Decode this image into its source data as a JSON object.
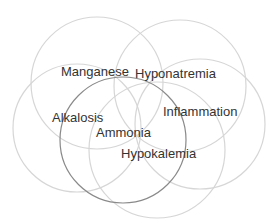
{
  "diagram": {
    "type": "overlapping-circles",
    "colors": {
      "background": "#ffffff",
      "light_circle": "#d6d6d6",
      "dark_circle": "#8a8a8a",
      "text": "#333333"
    },
    "circles": [
      {
        "name": "manganese",
        "cx": 97,
        "cy": 83,
        "r": 66,
        "style": "light"
      },
      {
        "name": "hyponatremia",
        "cx": 180,
        "cy": 86,
        "r": 66,
        "style": "light"
      },
      {
        "name": "alkalosis",
        "cx": 77,
        "cy": 128,
        "r": 64,
        "style": "light"
      },
      {
        "name": "inflammation",
        "cx": 200,
        "cy": 124,
        "r": 65,
        "style": "light"
      },
      {
        "name": "hypokalemia",
        "cx": 157,
        "cy": 150,
        "r": 68,
        "style": "light"
      },
      {
        "name": "ammonia",
        "cx": 123,
        "cy": 140,
        "r": 63,
        "style": "dark"
      }
    ],
    "labels": [
      {
        "text": "Manganese",
        "x": 61,
        "y": 73
      },
      {
        "text": "Hyponatremia",
        "x": 135,
        "y": 75
      },
      {
        "text": "Alkalosis",
        "x": 52,
        "y": 119
      },
      {
        "text": "Inflammation",
        "x": 163,
        "y": 113
      },
      {
        "text": "Ammonia",
        "x": 96,
        "y": 134
      },
      {
        "text": "Hypokalemia",
        "x": 121,
        "y": 155
      }
    ]
  }
}
